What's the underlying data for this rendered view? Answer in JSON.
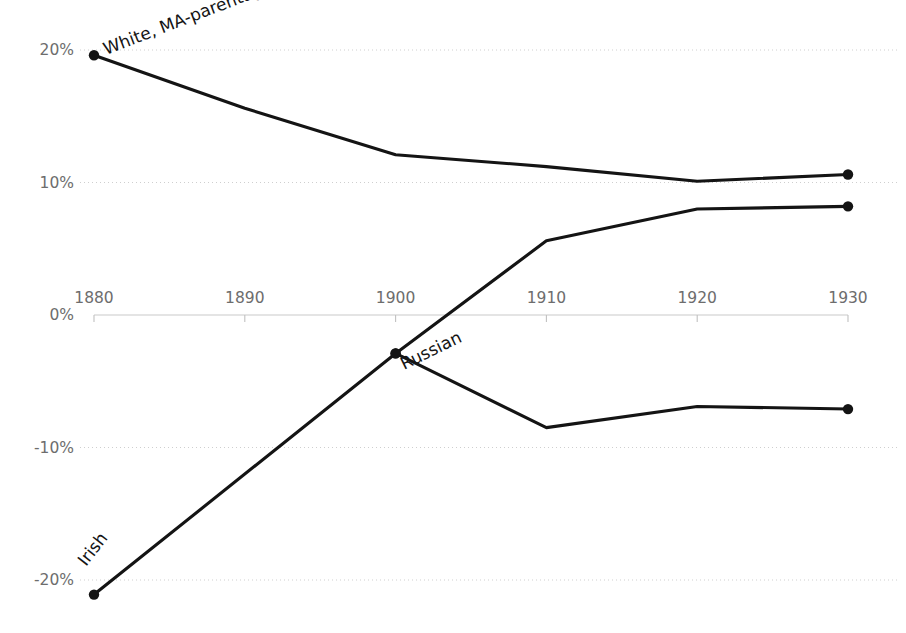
{
  "chart_data": {
    "type": "line",
    "title": "",
    "subtitle": "",
    "xlabel": "",
    "ylabel": "",
    "x": [
      1880,
      1890,
      1900,
      1910,
      1920,
      1930
    ],
    "xtick_labels": [
      "1880",
      "1890",
      "1900",
      "1910",
      "1920",
      "1930"
    ],
    "xlim": [
      1880,
      1930
    ],
    "ylim": [
      -22,
      21
    ],
    "ytick_values": [
      20,
      10,
      0,
      -10,
      -20
    ],
    "ytick_labels": [
      "20%",
      "10%",
      "0%",
      "-10%",
      "-20%"
    ],
    "grid": true,
    "grid_style": "dotted-horizontal",
    "legend": "inline-series-labels",
    "axis_zero_line": 0,
    "series": [
      {
        "name": "White, MA-parentage",
        "label": "White, MA-parentage",
        "color": "#141414",
        "x": [
          1880,
          1890,
          1900,
          1910,
          1920,
          1930
        ],
        "values": [
          19.6,
          15.6,
          12.1,
          11.2,
          10.1,
          10.6
        ],
        "markers_at": [
          1880,
          1930
        ],
        "label_angle_deg": -21,
        "label_x_px": 106,
        "label_y_px": 55
      },
      {
        "name": "Russian",
        "label": "Russian",
        "color": "#141414",
        "x": [
          1900,
          1910,
          1920,
          1930
        ],
        "values": [
          -2.9,
          5.6,
          8.0,
          8.2
        ],
        "markers_at": [
          1900,
          1930
        ],
        "label_angle_deg": -26,
        "label_x_px": 404,
        "label_y_px": 370
      },
      {
        "name": "Irish",
        "label": "Irish",
        "color": "#141414",
        "x": [
          1880,
          1900,
          1910,
          1920,
          1930
        ],
        "values": [
          -21.1,
          -2.9,
          -8.5,
          -6.9,
          -7.1
        ],
        "markers_at": [
          1880,
          1900,
          1930
        ],
        "label_angle_deg": -52,
        "label_x_px": 86,
        "label_y_px": 567
      }
    ],
    "annotations": [
      {
        "text": "White, MA-parentage",
        "kind": "series-label"
      },
      {
        "text": "Russian",
        "kind": "series-label"
      },
      {
        "text": "Irish",
        "kind": "series-label"
      }
    ],
    "colors": {
      "line": "#141414",
      "grid": "#cfcfcf",
      "axis": "#c9c9c9",
      "tick_text": "#6d6d6d",
      "label_text": "#141414",
      "background": "#ffffff"
    }
  }
}
